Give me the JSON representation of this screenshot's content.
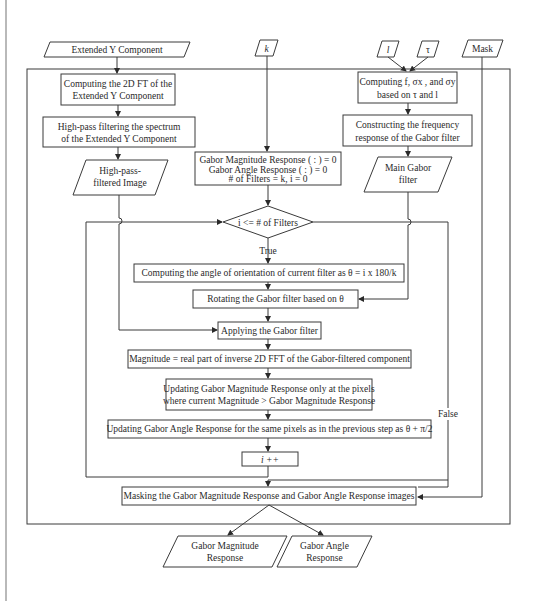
{
  "diagram": {
    "type": "flowchart",
    "inputs": {
      "extended_y": "Extended Y Component",
      "k": "k",
      "l": "l",
      "tau": "τ",
      "mask": "Mask"
    },
    "left_branch": {
      "fft_box": [
        "Computing the 2D FT of the",
        "Extended Y Component"
      ],
      "highpass_box": [
        "High-pass filtering the spectrum",
        "of the Extended Y Component"
      ],
      "highpass_output": [
        "High-pass-",
        "filtered Image"
      ]
    },
    "right_branch": {
      "compute_params_box": [
        "Computing f, σx , and σy",
        "based on τ and l"
      ],
      "construct_box": [
        "Constructing the frequency",
        "response of the Gabor filter"
      ],
      "main_filter_output": [
        "Main Gabor",
        "filter"
      ]
    },
    "init_box": [
      "Gabor Magnitude Response ( : ) = 0",
      "Gabor Angle Response ( : ) = 0",
      "# of Filters = k, i = 0"
    ],
    "loop_condition": "i <= # of Filters",
    "true_label": "True",
    "false_label": "False",
    "loop_steps": [
      "Computing the angle of orientation of current filter as θ  = i x 180/k",
      "Rotating the Gabor filter based on θ",
      "Applying the Gabor filter",
      "Magnitude = real part of inverse 2D FFT of the Gabor-filtered component",
      [
        "Updating Gabor Magnitude Response only at the pixels",
        "where current Magnitude > Gabor Magnitude Response"
      ],
      "Updating Gabor Angle Response for the same pixels as in the previous step as θ + π/2",
      "i ++"
    ],
    "mask_step": "Masking the Gabor Magnitude Response and Gabor Angle Response images",
    "outputs": {
      "magnitude": [
        "Gabor Magnitude",
        "Response"
      ],
      "angle": [
        "Gabor Angle",
        "Response"
      ]
    },
    "colors": {
      "stroke": "#3a3a3a",
      "connector": "#8a8a8a",
      "background": "#ffffff",
      "text": "#2a2a2a"
    }
  }
}
